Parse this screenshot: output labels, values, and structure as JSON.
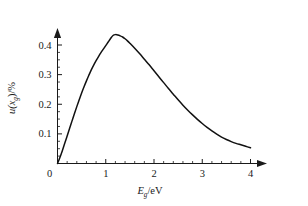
{
  "chart_data": {
    "type": "line",
    "title": "",
    "subtitle": "",
    "xlabel": "E_g/eV",
    "xlabel_main": "E",
    "xlabel_sub": "g",
    "xlabel_unit": "/eV",
    "ylabel": "u(x_g)/%",
    "ylabel_main": "u(x",
    "ylabel_sub": "g",
    "ylabel_tail": ")/%",
    "xlim": [
      0,
      4.35
    ],
    "ylim": [
      0,
      0.465
    ],
    "grid": false,
    "legend": null,
    "x_ticks": [
      0,
      1,
      2,
      3,
      4
    ],
    "x_tick_labels": [
      "0",
      "1",
      "2",
      "3",
      "4"
    ],
    "x_minor_step": 0.2,
    "y_ticks": [
      0,
      0.1,
      0.2,
      0.3,
      0.4
    ],
    "y_tick_labels": [
      "0",
      "0.1",
      "0.2",
      "0.3",
      "0.4"
    ],
    "y_minor_step": 0.025,
    "x_axis_arrow": true,
    "y_axis_arrow": true,
    "peak": {
      "x": 1.15,
      "y": 0.435
    },
    "line_color": "#111111",
    "axis_color": "#1a1a1a",
    "background_color": "#ffffff",
    "x": [
      0.0,
      0.05,
      0.1,
      0.15,
      0.2,
      0.25,
      0.3,
      0.35,
      0.4,
      0.45,
      0.5,
      0.55,
      0.6,
      0.65,
      0.7,
      0.75,
      0.8,
      0.85,
      0.9,
      0.95,
      1.0,
      1.05,
      1.1,
      1.15,
      1.2,
      1.25,
      1.3,
      1.35,
      1.4,
      1.45,
      1.5,
      1.6,
      1.7,
      1.8,
      1.9,
      2.0,
      2.1,
      2.2,
      2.3,
      2.4,
      2.5,
      2.6,
      2.7,
      2.8,
      2.9,
      3.0,
      3.1,
      3.2,
      3.3,
      3.4,
      3.5,
      3.6,
      3.7,
      3.8,
      3.9,
      4.0
    ],
    "values": [
      0.0,
      0.02,
      0.043,
      0.068,
      0.093,
      0.118,
      0.143,
      0.168,
      0.192,
      0.215,
      0.238,
      0.259,
      0.279,
      0.298,
      0.316,
      0.332,
      0.347,
      0.361,
      0.374,
      0.386,
      0.398,
      0.41,
      0.422,
      0.432,
      0.435,
      0.434,
      0.431,
      0.427,
      0.421,
      0.414,
      0.406,
      0.389,
      0.371,
      0.352,
      0.333,
      0.313,
      0.293,
      0.273,
      0.253,
      0.234,
      0.215,
      0.197,
      0.18,
      0.164,
      0.149,
      0.135,
      0.122,
      0.11,
      0.099,
      0.089,
      0.081,
      0.074,
      0.068,
      0.063,
      0.058,
      0.053
    ]
  }
}
